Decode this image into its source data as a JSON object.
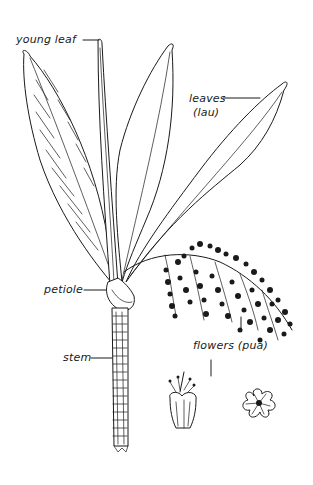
{
  "figure": {
    "labels": {
      "young_leaf": "young leaf",
      "leaves": "leaves",
      "leaves_hawaiian": "(lau)",
      "petiole": "petiole",
      "stem": "stem",
      "flowers": "flowers (pua)"
    },
    "colors": {
      "ink": "#1a1a1a",
      "background": "#ffffff"
    }
  }
}
